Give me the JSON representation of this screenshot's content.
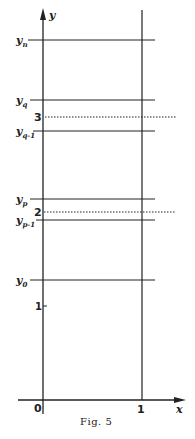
{
  "figure": {
    "caption": "Fig. 5",
    "axes": {
      "x_label": "x",
      "y_label": "y",
      "origin_label": "0",
      "x_tick_label": "1",
      "y_tick_label": "1"
    },
    "horizontal_lines": [
      {
        "id": "y_n",
        "base": "y",
        "sub": "n",
        "style": "solid"
      },
      {
        "id": "y_q",
        "base": "y",
        "sub": "q",
        "style": "solid"
      },
      {
        "id": "level_3",
        "label": "3",
        "style": "dotted"
      },
      {
        "id": "y_q-1",
        "base": "y",
        "sub": "q-1",
        "style": "solid"
      },
      {
        "id": "y_p",
        "base": "y",
        "sub": "p",
        "style": "solid"
      },
      {
        "id": "level_2",
        "label": "2",
        "style": "dotted"
      },
      {
        "id": "y_p-1",
        "base": "y",
        "sub": "p-1",
        "style": "solid"
      },
      {
        "id": "y_0",
        "base": "y",
        "sub": "0",
        "style": "solid"
      }
    ],
    "colors": {
      "ink": "#222222",
      "background": "#ffffff"
    }
  }
}
